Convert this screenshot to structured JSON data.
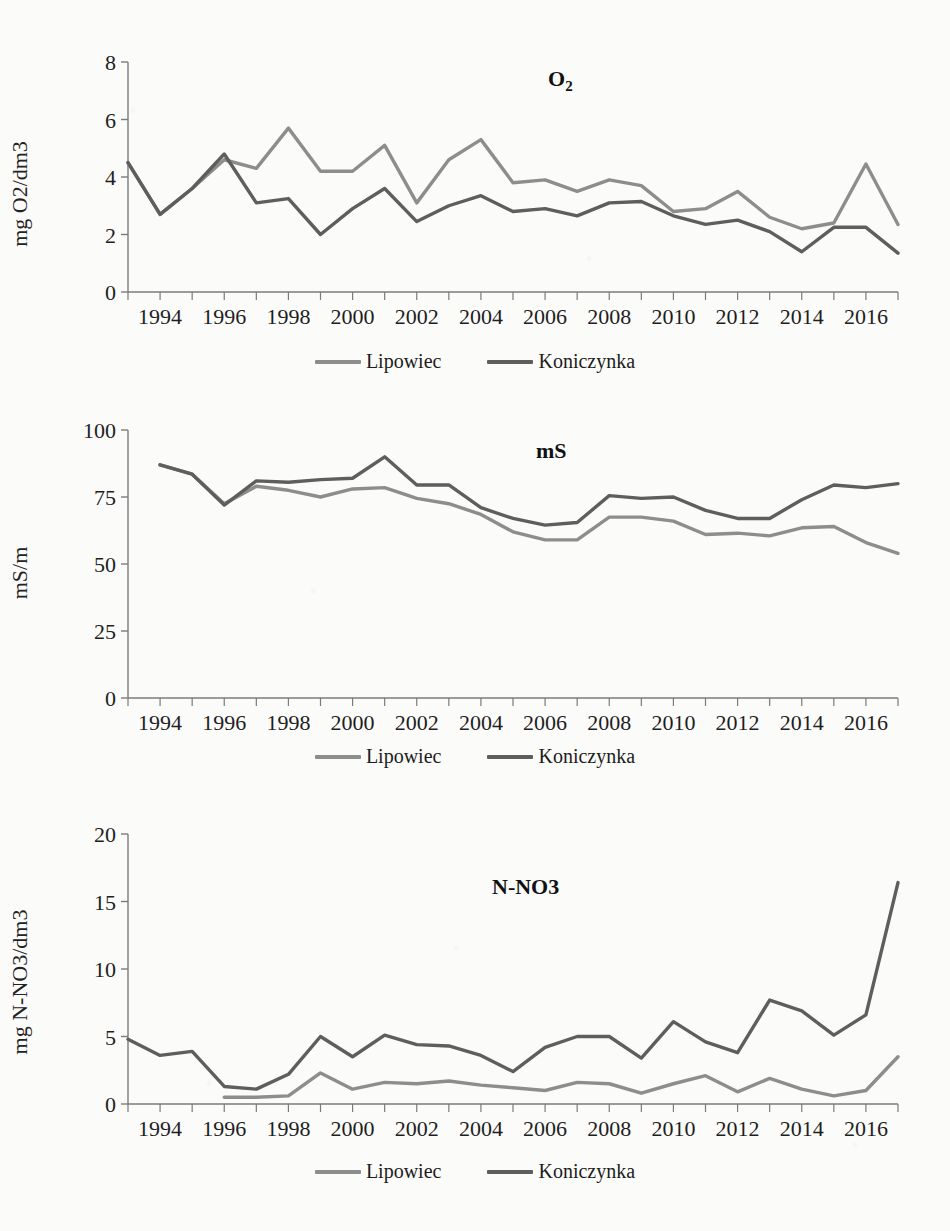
{
  "document": {
    "cut_off_title": "",
    "series_colors": {
      "lipowiec": "#8d8d8d",
      "koniczynka": "#5e5e5e"
    },
    "legend": {
      "lipowiec_label": "Lipowiec",
      "koniczynka_label": "Koniczynka"
    }
  },
  "chart_data": [
    {
      "id": "o2",
      "type": "line",
      "title": "O2",
      "title_html": "O<sub>2</sub>",
      "xlabel": "",
      "ylabel": "mg O2/dm3",
      "ylim": [
        0,
        8
      ],
      "yticks": [
        0,
        2,
        4,
        6,
        8
      ],
      "ytick_labels": [
        "0",
        "2",
        "4",
        "6",
        "8"
      ],
      "xlim": [
        1993,
        2017
      ],
      "x": [
        1993,
        1994,
        1995,
        1996,
        1997,
        1998,
        1999,
        2000,
        2001,
        2002,
        2003,
        2004,
        2005,
        2006,
        2007,
        2008,
        2009,
        2010,
        2011,
        2012,
        2013,
        2014,
        2015,
        2016,
        2017
      ],
      "xticks": [
        1994,
        1996,
        1998,
        2000,
        2002,
        2004,
        2006,
        2008,
        2010,
        2012,
        2014,
        2016
      ],
      "xtick_labels": [
        "1994",
        "1996",
        "1998",
        "2000",
        "2002",
        "2004",
        "2006",
        "2008",
        "2010",
        "2012",
        "2014",
        "2016"
      ],
      "grid": false,
      "legend_position": "bottom",
      "series": [
        {
          "name": "Lipowiec",
          "color": "#8d8d8d",
          "values": [
            4.5,
            2.7,
            3.6,
            4.6,
            4.3,
            5.7,
            4.2,
            4.2,
            5.1,
            3.1,
            4.6,
            5.3,
            3.8,
            3.9,
            3.5,
            3.9,
            3.7,
            2.8,
            2.9,
            3.5,
            2.6,
            2.2,
            2.4,
            4.45,
            2.35
          ]
        },
        {
          "name": "Koniczynka",
          "color": "#5e5e5e",
          "values": [
            4.5,
            2.7,
            3.6,
            4.8,
            3.1,
            3.25,
            2.0,
            2.9,
            3.6,
            2.45,
            3.0,
            3.35,
            2.8,
            2.9,
            2.65,
            3.1,
            3.15,
            2.65,
            2.35,
            2.5,
            2.1,
            1.4,
            2.25,
            2.25,
            1.35
          ]
        }
      ]
    },
    {
      "id": "ms",
      "type": "line",
      "title": "mS",
      "title_html": "mS",
      "xlabel": "",
      "ylabel": "mS/m",
      "ylim": [
        0,
        100
      ],
      "yticks": [
        0,
        25,
        50,
        75,
        100
      ],
      "ytick_labels": [
        "0",
        "25",
        "50",
        "75",
        "100"
      ],
      "xlim": [
        1993,
        2017
      ],
      "x": [
        1994,
        1995,
        1996,
        1997,
        1998,
        1999,
        2000,
        2001,
        2002,
        2003,
        2004,
        2005,
        2006,
        2007,
        2008,
        2009,
        2010,
        2011,
        2012,
        2013,
        2014,
        2015,
        2016,
        2017
      ],
      "xticks": [
        1994,
        1996,
        1998,
        2000,
        2002,
        2004,
        2006,
        2008,
        2010,
        2012,
        2014,
        2016
      ],
      "xtick_labels": [
        "1994",
        "1996",
        "1998",
        "2000",
        "2002",
        "2004",
        "2006",
        "2008",
        "2010",
        "2012",
        "2014",
        "2016"
      ],
      "grid": false,
      "legend_position": "bottom",
      "series": [
        {
          "name": "Lipowiec",
          "color": "#8d8d8d",
          "values": [
            87.0,
            83.5,
            72.5,
            79.0,
            77.5,
            75.0,
            78.0,
            78.5,
            74.5,
            72.5,
            68.5,
            62.0,
            59.0,
            59.0,
            67.5,
            67.5,
            66.0,
            61.0,
            61.5,
            60.5,
            63.5,
            64.0,
            58.0,
            54.0
          ]
        },
        {
          "name": "Koniczynka",
          "color": "#5e5e5e",
          "values": [
            87.0,
            83.5,
            72.0,
            81.0,
            80.5,
            81.5,
            82.0,
            90.0,
            79.5,
            79.5,
            71.0,
            67.0,
            64.5,
            65.5,
            75.5,
            74.5,
            75.0,
            70.0,
            67.0,
            67.0,
            74.0,
            79.5,
            78.5,
            80.0
          ]
        }
      ]
    },
    {
      "id": "n-no3",
      "type": "line",
      "title": "N-NO3",
      "title_html": "N-NO3",
      "xlabel": "",
      "ylabel": "mg N-NO3/dm3",
      "ylim": [
        0,
        20
      ],
      "yticks": [
        0,
        5,
        10,
        15,
        20
      ],
      "ytick_labels": [
        "0",
        "5",
        "10",
        "15",
        "20"
      ],
      "xlim": [
        1993,
        2017
      ],
      "x": [
        1993,
        1994,
        1995,
        1996,
        1997,
        1998,
        1999,
        2000,
        2001,
        2002,
        2003,
        2004,
        2005,
        2006,
        2007,
        2008,
        2009,
        2010,
        2011,
        2012,
        2013,
        2014,
        2015,
        2016,
        2017
      ],
      "xticks": [
        1994,
        1996,
        1998,
        2000,
        2002,
        2004,
        2006,
        2008,
        2010,
        2012,
        2014,
        2016
      ],
      "xtick_labels": [
        "1994",
        "1996",
        "1998",
        "2000",
        "2002",
        "2004",
        "2006",
        "2008",
        "2010",
        "2012",
        "2014",
        "2016"
      ],
      "grid": false,
      "legend_position": "bottom",
      "series": [
        {
          "name": "Lipowiec",
          "color": "#8d8d8d",
          "values": [
            null,
            null,
            null,
            0.5,
            0.5,
            0.6,
            2.3,
            1.1,
            1.6,
            1.5,
            1.7,
            1.4,
            1.2,
            1.0,
            1.6,
            1.5,
            0.8,
            1.5,
            2.1,
            0.9,
            1.9,
            1.1,
            0.6,
            1.0,
            3.5
          ]
        },
        {
          "name": "Koniczynka",
          "color": "#5e5e5e",
          "values": [
            4.8,
            3.6,
            3.9,
            1.3,
            1.1,
            2.2,
            5.0,
            3.5,
            5.1,
            4.4,
            4.3,
            3.6,
            2.4,
            4.2,
            5.0,
            5.0,
            3.4,
            6.1,
            4.6,
            3.8,
            7.7,
            6.9,
            5.1,
            6.6,
            16.4
          ]
        }
      ]
    }
  ]
}
